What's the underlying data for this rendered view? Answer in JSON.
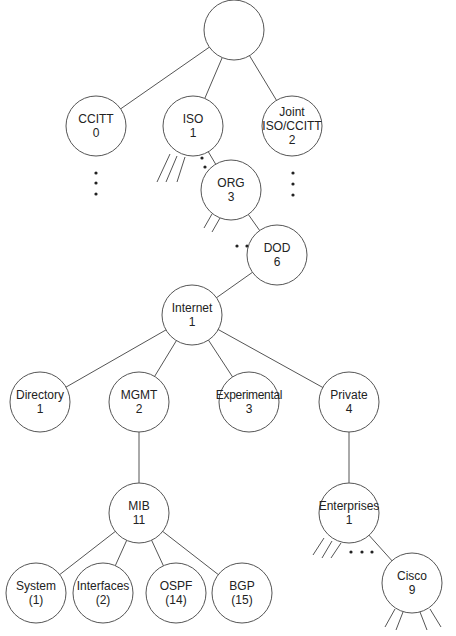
{
  "diagram": {
    "type": "tree",
    "nodes": [
      {
        "id": "root",
        "lines": [],
        "x": 234,
        "y": 30,
        "r": 30
      },
      {
        "id": "ccitt",
        "lines": [
          "CCITT",
          "0"
        ],
        "x": 96,
        "y": 126,
        "r": 30
      },
      {
        "id": "iso",
        "lines": [
          "ISO",
          "1"
        ],
        "x": 193,
        "y": 126,
        "r": 30
      },
      {
        "id": "joint",
        "lines": [
          "Joint",
          "ISO/CCITT",
          "2"
        ],
        "x": 292,
        "y": 126,
        "r": 30
      },
      {
        "id": "org",
        "lines": [
          "ORG",
          "3"
        ],
        "x": 231,
        "y": 190,
        "r": 30
      },
      {
        "id": "dod",
        "lines": [
          "DOD",
          "6"
        ],
        "x": 277,
        "y": 255,
        "r": 30
      },
      {
        "id": "internet",
        "lines": [
          "Internet",
          "1"
        ],
        "x": 192,
        "y": 315,
        "r": 30
      },
      {
        "id": "directory",
        "lines": [
          "Directory",
          "1"
        ],
        "x": 40,
        "y": 402,
        "r": 30
      },
      {
        "id": "mgmt",
        "lines": [
          "MGMT",
          "2"
        ],
        "x": 139,
        "y": 402,
        "r": 30
      },
      {
        "id": "experimental",
        "lines": [
          "Experimental",
          "3"
        ],
        "x": 249,
        "y": 402,
        "r": 30
      },
      {
        "id": "private",
        "lines": [
          "Private",
          "4"
        ],
        "x": 349,
        "y": 402,
        "r": 30
      },
      {
        "id": "mib",
        "lines": [
          "MIB",
          "11"
        ],
        "x": 139,
        "y": 513,
        "r": 30
      },
      {
        "id": "enterprises",
        "lines": [
          "Enterprises",
          "1"
        ],
        "x": 349,
        "y": 513,
        "r": 30
      },
      {
        "id": "system",
        "lines": [
          "System",
          "(1)"
        ],
        "x": 36,
        "y": 593,
        "r": 30
      },
      {
        "id": "interfaces",
        "lines": [
          "Interfaces",
          "(2)"
        ],
        "x": 103,
        "y": 593,
        "r": 30
      },
      {
        "id": "ospf",
        "lines": [
          "OSPF",
          "(14)"
        ],
        "x": 176,
        "y": 593,
        "r": 30
      },
      {
        "id": "bgp",
        "lines": [
          "BGP",
          "(15)"
        ],
        "x": 242,
        "y": 593,
        "r": 30
      },
      {
        "id": "cisco",
        "lines": [
          "Cisco",
          "9"
        ],
        "x": 412,
        "y": 583,
        "r": 30
      }
    ],
    "edges": [
      [
        "root",
        "ccitt"
      ],
      [
        "root",
        "iso"
      ],
      [
        "root",
        "joint"
      ],
      [
        "iso",
        "org"
      ],
      [
        "org",
        "dod"
      ],
      [
        "dod",
        "internet"
      ],
      [
        "internet",
        "directory"
      ],
      [
        "internet",
        "mgmt"
      ],
      [
        "internet",
        "experimental"
      ],
      [
        "internet",
        "private"
      ],
      [
        "mgmt",
        "mib"
      ],
      [
        "private",
        "enterprises"
      ],
      [
        "mib",
        "system"
      ],
      [
        "mib",
        "interfaces"
      ],
      [
        "mib",
        "ospf"
      ],
      [
        "mib",
        "bgp"
      ],
      [
        "enterprises",
        "cisco"
      ]
    ],
    "stubs": [
      [
        [
          170,
          154
        ],
        [
          157,
          182
        ]
      ],
      [
        [
          177,
          156
        ],
        [
          166,
          182
        ]
      ],
      [
        [
          185,
          157
        ],
        [
          177,
          182
        ]
      ],
      [
        [
          212,
          214
        ],
        [
          204,
          228
        ]
      ],
      [
        [
          220,
          218
        ],
        [
          212,
          232
        ]
      ],
      [
        [
          324,
          538
        ],
        [
          313,
          555
        ]
      ],
      [
        [
          332,
          541
        ],
        [
          322,
          558
        ]
      ],
      [
        [
          341,
          543
        ],
        [
          331,
          558
        ]
      ],
      [
        [
          395,
          609
        ],
        [
          385,
          627
        ]
      ],
      [
        [
          403,
          612
        ],
        [
          396,
          630
        ]
      ],
      [
        [
          420,
          612
        ],
        [
          427,
          630
        ]
      ],
      [
        [
          430,
          609
        ],
        [
          441,
          627
        ]
      ]
    ],
    "ellipsis_dots": [
      [
        96,
        173
      ],
      [
        96,
        183
      ],
      [
        96,
        194
      ],
      [
        202,
        158
      ],
      [
        205,
        167
      ],
      [
        207,
        176
      ],
      [
        293,
        173
      ],
      [
        293,
        184
      ],
      [
        293,
        195
      ],
      [
        237,
        246
      ],
      [
        247,
        246
      ],
      [
        257,
        246
      ],
      [
        351,
        552
      ],
      [
        362,
        552
      ],
      [
        372,
        552
      ]
    ]
  }
}
